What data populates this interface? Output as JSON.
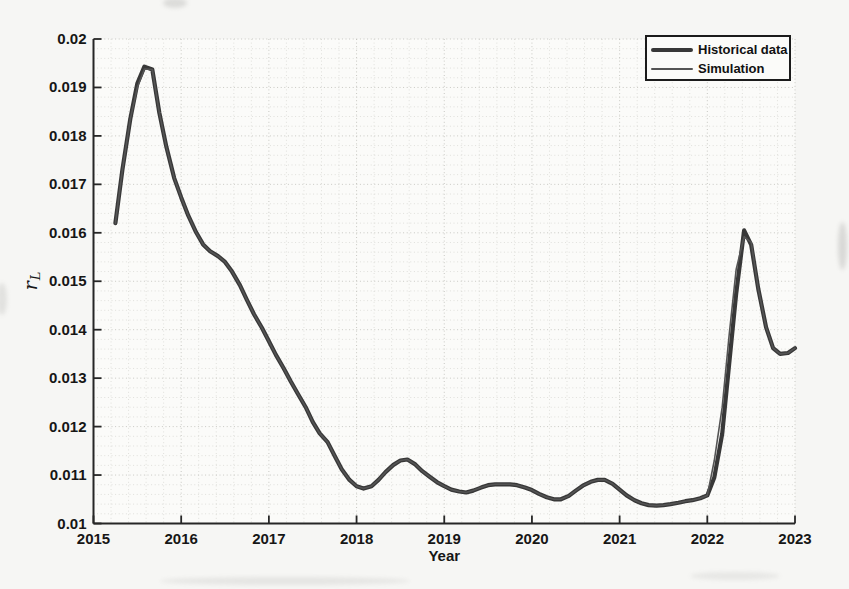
{
  "page": {
    "background": "#f6f6f4"
  },
  "chart_data": {
    "type": "line",
    "title": "",
    "xlabel": "Year",
    "ylabel": "r_L",
    "ylabel_main": "r",
    "ylabel_sub": "L",
    "xlim": [
      2015,
      2023
    ],
    "ylim": [
      0.01,
      0.02
    ],
    "x_ticks": [
      2015,
      2016,
      2017,
      2018,
      2019,
      2020,
      2021,
      2022,
      2023
    ],
    "x_tick_labels": [
      "2015",
      "2016",
      "2017",
      "2018",
      "2019",
      "2020",
      "2021",
      "2022",
      "2023"
    ],
    "y_ticks": [
      0.01,
      0.011,
      0.012,
      0.013,
      0.014,
      0.015,
      0.016,
      0.017,
      0.018,
      0.019,
      0.02
    ],
    "y_tick_labels": [
      "0.01",
      "0.011",
      "0.012",
      "0.013",
      "0.014",
      "0.015",
      "0.016",
      "0.017",
      "0.018",
      "0.019",
      "0.02"
    ],
    "grid": "minor-dotted",
    "minor_x_step": 0.2,
    "minor_y_step": 0.0002,
    "axis_color": "#262626",
    "legend": {
      "position": "top-right",
      "items": [
        {
          "label": "Historical data",
          "style": "thick",
          "color": "#383838"
        },
        {
          "label": "Simulation",
          "style": "thin",
          "color": "#545454"
        }
      ]
    },
    "series": [
      {
        "name": "Historical data",
        "color": "#383838",
        "width": 4.2,
        "x": [
          2015.25,
          2015.33,
          2015.42,
          2015.5,
          2015.58,
          2015.67,
          2015.75,
          2015.83,
          2015.92,
          2016.0,
          2016.08,
          2016.17,
          2016.25,
          2016.33,
          2016.42,
          2016.5,
          2016.58,
          2016.67,
          2016.75,
          2016.83,
          2016.92,
          2017.0,
          2017.08,
          2017.17,
          2017.25,
          2017.33,
          2017.42,
          2017.5,
          2017.58,
          2017.67,
          2017.75,
          2017.83,
          2017.92,
          2018.0,
          2018.08,
          2018.17,
          2018.25,
          2018.33,
          2018.42,
          2018.5,
          2018.58,
          2018.67,
          2018.75,
          2018.83,
          2018.92,
          2019.0,
          2019.08,
          2019.17,
          2019.25,
          2019.33,
          2019.42,
          2019.5,
          2019.58,
          2019.67,
          2019.75,
          2019.83,
          2019.92,
          2020.0,
          2020.08,
          2020.17,
          2020.25,
          2020.33,
          2020.42,
          2020.5,
          2020.58,
          2020.67,
          2020.75,
          2020.83,
          2020.92,
          2021.0,
          2021.08,
          2021.17,
          2021.25,
          2021.33,
          2021.42,
          2021.5,
          2021.58,
          2021.67,
          2021.75,
          2021.83,
          2021.92,
          2022.0,
          2022.08,
          2022.17,
          2022.25,
          2022.33,
          2022.42,
          2022.5,
          2022.58,
          2022.67,
          2022.75,
          2022.83,
          2022.92,
          2023.0
        ],
        "y": [
          0.0162,
          0.0173,
          0.01835,
          0.01908,
          0.01943,
          0.01937,
          0.01848,
          0.01778,
          0.01713,
          0.01673,
          0.01636,
          0.01601,
          0.01576,
          0.01562,
          0.01552,
          0.0154,
          0.0152,
          0.01492,
          0.01461,
          0.01432,
          0.01404,
          0.01376,
          0.01348,
          0.0132,
          0.01293,
          0.01268,
          0.0124,
          0.0121,
          0.01186,
          0.01168,
          0.0114,
          0.01112,
          0.0109,
          0.01077,
          0.01072,
          0.01077,
          0.0109,
          0.01106,
          0.01121,
          0.0113,
          0.01132,
          0.01122,
          0.01108,
          0.01097,
          0.01085,
          0.01077,
          0.0107,
          0.01066,
          0.01064,
          0.01068,
          0.01074,
          0.01079,
          0.01081,
          0.01081,
          0.01081,
          0.01079,
          0.01074,
          0.01069,
          0.01061,
          0.01054,
          0.0105,
          0.0105,
          0.01057,
          0.01068,
          0.01078,
          0.01086,
          0.0109,
          0.0109,
          0.01082,
          0.0107,
          0.01058,
          0.01048,
          0.01042,
          0.01038,
          0.01037,
          0.01038,
          0.0104,
          0.01043,
          0.01046,
          0.01048,
          0.01052,
          0.01058,
          0.01095,
          0.01185,
          0.0133,
          0.01475,
          0.01605,
          0.01575,
          0.01485,
          0.01405,
          0.01362,
          0.0135,
          0.01352,
          0.01362
        ]
      },
      {
        "name": "Simulation",
        "color": "#545454",
        "width": 1.6,
        "x": [
          2015.25,
          2015.33,
          2015.42,
          2015.5,
          2015.58,
          2015.67,
          2015.75,
          2015.83,
          2015.92,
          2016.0,
          2016.08,
          2016.17,
          2016.25,
          2016.33,
          2016.42,
          2016.5,
          2016.58,
          2016.67,
          2016.75,
          2016.83,
          2016.92,
          2017.0,
          2017.08,
          2017.17,
          2017.25,
          2017.33,
          2017.42,
          2017.5,
          2017.58,
          2017.67,
          2017.75,
          2017.83,
          2017.92,
          2018.0,
          2018.08,
          2018.17,
          2018.25,
          2018.33,
          2018.42,
          2018.5,
          2018.58,
          2018.67,
          2018.75,
          2018.83,
          2018.92,
          2019.0,
          2019.08,
          2019.17,
          2019.25,
          2019.33,
          2019.42,
          2019.5,
          2019.58,
          2019.67,
          2019.75,
          2019.83,
          2019.92,
          2020.0,
          2020.08,
          2020.17,
          2020.25,
          2020.33,
          2020.42,
          2020.5,
          2020.58,
          2020.67,
          2020.75,
          2020.83,
          2020.92,
          2021.0,
          2021.08,
          2021.17,
          2021.25,
          2021.33,
          2021.42,
          2021.5,
          2021.58,
          2021.67,
          2021.75,
          2021.83,
          2021.92,
          2022.0,
          2022.08,
          2022.17,
          2022.25,
          2022.33,
          2022.42,
          2022.5,
          2022.58,
          2022.67,
          2022.75,
          2022.83,
          2022.92,
          2023.0
        ],
        "y": [
          0.0162,
          0.0173,
          0.01835,
          0.019,
          0.01938,
          0.01937,
          0.01848,
          0.01778,
          0.01713,
          0.01673,
          0.01636,
          0.01601,
          0.01576,
          0.01562,
          0.01552,
          0.0154,
          0.0152,
          0.01492,
          0.01461,
          0.01432,
          0.01404,
          0.01376,
          0.01348,
          0.0132,
          0.01293,
          0.01268,
          0.0124,
          0.0121,
          0.01186,
          0.01168,
          0.0114,
          0.01112,
          0.0109,
          0.01077,
          0.01072,
          0.01077,
          0.0109,
          0.01106,
          0.01121,
          0.0113,
          0.01132,
          0.01122,
          0.01108,
          0.01097,
          0.01085,
          0.01077,
          0.0107,
          0.01066,
          0.01064,
          0.01068,
          0.01074,
          0.01079,
          0.01081,
          0.01081,
          0.01081,
          0.01079,
          0.01074,
          0.01069,
          0.01061,
          0.01054,
          0.0105,
          0.0105,
          0.01057,
          0.01068,
          0.01078,
          0.01086,
          0.0109,
          0.0109,
          0.01082,
          0.0107,
          0.01058,
          0.01048,
          0.01042,
          0.01038,
          0.01037,
          0.01038,
          0.0104,
          0.01043,
          0.01046,
          0.01048,
          0.01052,
          0.01058,
          0.0113,
          0.0124,
          0.0139,
          0.01525,
          0.01592,
          0.0158,
          0.01485,
          0.01405,
          0.01362,
          0.0135,
          0.01352,
          0.01362
        ]
      }
    ]
  }
}
